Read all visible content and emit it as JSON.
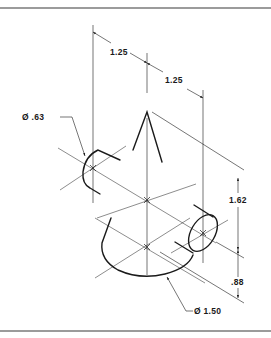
{
  "figure": {
    "type": "isometric technical drawing",
    "line_color": "#1a1a1a",
    "border_color": "#7a7a7a",
    "background": "#ffffff"
  },
  "dimensions": {
    "top_left_horizontal": "1.25",
    "top_right_horizontal": "1.25",
    "small_diameter": "Ø .63",
    "vertical_upper": "1.62",
    "vertical_lower": ".88",
    "large_diameter": "Ø 1.50"
  }
}
